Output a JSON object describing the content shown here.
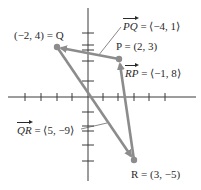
{
  "diagram": {
    "colors": {
      "axis": "#3a3a3a",
      "vector": "#8c8c8c",
      "point": "#8c8c8c",
      "text": "#2a2a2a"
    },
    "points": {
      "Q": {
        "name": "Q",
        "coords": "(−2, 4)",
        "label": "(−2, 4) = Q"
      },
      "P": {
        "name": "P",
        "coords": "(2, 3)",
        "label": "P = (2, 3)"
      },
      "R": {
        "name": "R",
        "coords": "(3, −5)",
        "label": "R = (3, −5)"
      }
    },
    "vectors": {
      "PQ": {
        "name": "PQ",
        "value": "= ⟨−4, 1⟩"
      },
      "RP": {
        "name": "RP",
        "value": "= ⟨−1, 8⟩"
      },
      "QR": {
        "name": "QR",
        "value": "= ⟨5, −9⟩"
      }
    }
  }
}
